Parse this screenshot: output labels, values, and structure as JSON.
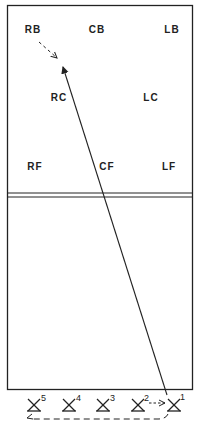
{
  "diagram": {
    "positions": [
      {
        "label": "RB",
        "x": 33,
        "y": 33
      },
      {
        "label": "CB",
        "x": 97,
        "y": 33
      },
      {
        "label": "LB",
        "x": 172,
        "y": 33
      },
      {
        "label": "RC",
        "x": 59,
        "y": 100
      },
      {
        "label": "LC",
        "x": 151,
        "y": 100
      },
      {
        "label": "RF",
        "x": 35,
        "y": 170
      },
      {
        "label": "CF",
        "x": 107,
        "y": 170
      },
      {
        "label": "LF",
        "x": 169,
        "y": 170
      }
    ],
    "servers": [
      {
        "num": "5",
        "x": 34
      },
      {
        "num": "4",
        "x": 69
      },
      {
        "num": "3",
        "x": 103
      },
      {
        "num": "2",
        "x": 138
      },
      {
        "num": "1",
        "x": 174
      }
    ],
    "colors": {
      "line": "#222222",
      "background": "#ffffff"
    }
  }
}
